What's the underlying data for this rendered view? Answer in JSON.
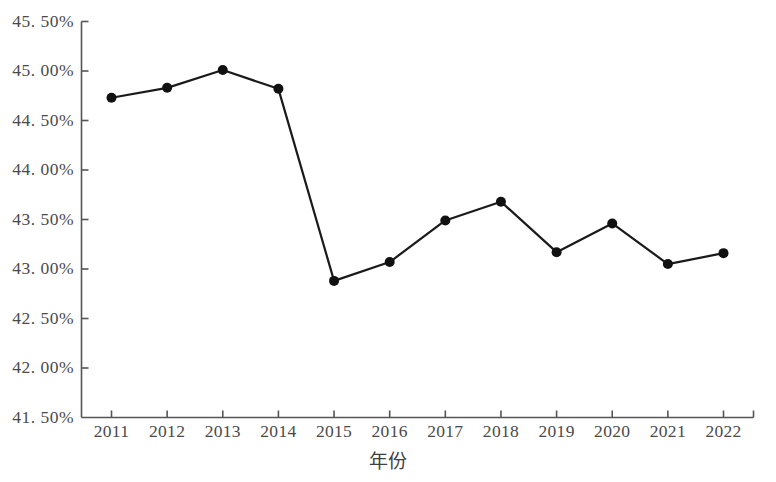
{
  "chart_data": {
    "type": "line",
    "title": "",
    "xlabel": "年份",
    "ylabel": "",
    "categories": [
      "2011",
      "2012",
      "2013",
      "2014",
      "2015",
      "2016",
      "2017",
      "2018",
      "2019",
      "2020",
      "2021",
      "2022"
    ],
    "values": [
      44.73,
      44.83,
      45.01,
      44.82,
      42.88,
      43.07,
      43.49,
      43.68,
      43.17,
      43.46,
      43.05,
      43.16
    ],
    "series": [
      {
        "name": "比重",
        "values": [
          44.73,
          44.83,
          45.01,
          44.82,
          42.88,
          43.07,
          43.49,
          43.68,
          43.17,
          43.46,
          43.05,
          43.16
        ]
      }
    ],
    "ylim": [
      41.5,
      45.5
    ],
    "ytick_values": [
      45.5,
      45.0,
      44.5,
      44.0,
      43.5,
      43.0,
      42.5,
      42.0,
      41.5
    ],
    "ytick_labels": [
      "45. 50%",
      "45. 00%",
      "44. 50%",
      "44. 00%",
      "43. 50%",
      "43. 00%",
      "42. 50%",
      "42. 00%",
      "41. 50%"
    ],
    "grid": false,
    "legend": "none",
    "line_color": "#1a1a1a",
    "marker_color": "#111111",
    "axis_color": "#555555"
  },
  "axes": {
    "x_title": "年份",
    "x_labels": [
      "2011",
      "2012",
      "2013",
      "2014",
      "2015",
      "2016",
      "2017",
      "2018",
      "2019",
      "2020",
      "2021",
      "2022"
    ],
    "y_labels": [
      "45. 50%",
      "45. 00%",
      "44. 50%",
      "44. 00%",
      "43. 50%",
      "43. 00%",
      "42. 50%",
      "42. 00%",
      "41. 50%"
    ]
  }
}
